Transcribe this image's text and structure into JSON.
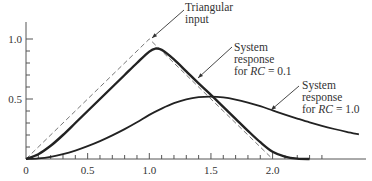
{
  "chart_data": {
    "type": "line",
    "title": "",
    "xlabel": "",
    "ylabel": "",
    "xlim": [
      0,
      2.75
    ],
    "ylim": [
      0,
      1.1
    ],
    "grid": false,
    "x_ticks": [
      {
        "value": 0,
        "label": "0"
      },
      {
        "value": 0.5,
        "label": "0.5"
      },
      {
        "value": 1.0,
        "label": "1.0"
      },
      {
        "value": 1.5,
        "label": "1.5"
      },
      {
        "value": 2.0,
        "label": "2.0"
      }
    ],
    "x_minor_tick_step": 0.1,
    "x_minor_tick_max": 2.4,
    "y_ticks": [
      {
        "value": 0.5,
        "label": "0.5"
      },
      {
        "value": 1.0,
        "label": "1.0"
      }
    ],
    "y_minor_tick_step": 0.1,
    "series": [
      {
        "name": "Triangular input",
        "style": "dashed",
        "x": [
          0,
          1.0,
          2.0
        ],
        "y": [
          0,
          1.0,
          0
        ]
      },
      {
        "name": "System response for RC = 0.1",
        "style": "solid-bold",
        "x": [
          0,
          0.1,
          0.2,
          0.3,
          0.4,
          0.5,
          0.6,
          0.7,
          0.8,
          0.9,
          1.0,
          1.05,
          1.1,
          1.2,
          1.3,
          1.4,
          1.5,
          1.6,
          1.7,
          1.8,
          1.9,
          2.0,
          2.1,
          2.2,
          2.3
        ],
        "y": [
          0,
          0.04,
          0.11,
          0.2,
          0.3,
          0.4,
          0.5,
          0.6,
          0.7,
          0.8,
          0.895,
          0.92,
          0.91,
          0.83,
          0.73,
          0.63,
          0.535,
          0.435,
          0.335,
          0.235,
          0.14,
          0.06,
          0.02,
          0.003,
          0
        ]
      },
      {
        "name": "System response for RC = 1.0",
        "style": "solid",
        "x": [
          0,
          0.1,
          0.2,
          0.3,
          0.4,
          0.5,
          0.6,
          0.7,
          0.8,
          0.9,
          1.0,
          1.1,
          1.2,
          1.3,
          1.4,
          1.5,
          1.6,
          1.7,
          1.8,
          1.9,
          2.0,
          2.1,
          2.2,
          2.3,
          2.4,
          2.5,
          2.6,
          2.7
        ],
        "y": [
          0,
          0.005,
          0.018,
          0.04,
          0.07,
          0.107,
          0.149,
          0.197,
          0.249,
          0.306,
          0.368,
          0.42,
          0.465,
          0.497,
          0.515,
          0.52,
          0.513,
          0.495,
          0.47,
          0.44,
          0.405,
          0.37,
          0.337,
          0.305,
          0.276,
          0.25,
          0.226,
          0.205
        ]
      }
    ],
    "annotations": [
      {
        "text_lines": [
          "Triangular",
          "input"
        ],
        "points_to": {
          "x": 1.0,
          "y": 1.0
        }
      },
      {
        "text_lines": [
          "System",
          "response",
          "for RC = 0.1"
        ],
        "points_to": {
          "x": 1.2,
          "y": 0.83
        }
      },
      {
        "text_lines": [
          "System",
          "response",
          "for RC = 1.0"
        ],
        "points_to": {
          "x": 2.02,
          "y": 0.4
        }
      }
    ]
  },
  "annotations": {
    "triangular": {
      "line1": "Triangular",
      "line2": "input"
    },
    "rc01": {
      "line1": "System",
      "line2": "response",
      "line3_prefix": "for ",
      "line3_var": "RC",
      "line3_suffix": " = 0.1"
    },
    "rc10": {
      "line1": "System",
      "line2": "response",
      "line3_prefix": "for ",
      "line3_var": "RC",
      "line3_suffix": " = 1.0"
    }
  }
}
